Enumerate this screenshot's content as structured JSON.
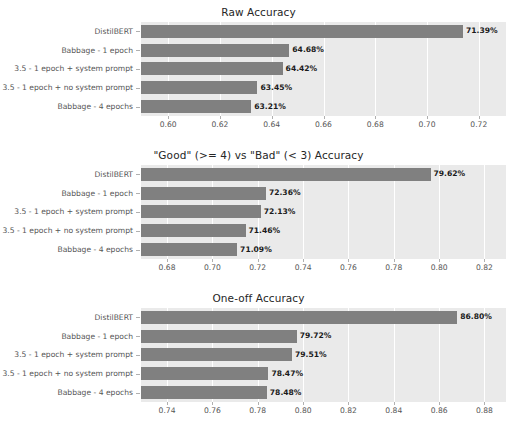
{
  "figure": {
    "width": 517,
    "height": 429,
    "background_color": "#ffffff",
    "plot_background_color": "#eaeaea",
    "bar_color": "#808080",
    "gridline_color": "#ffffff",
    "tick_label_color": "#555555",
    "title_color": "#262626",
    "value_label_color": "#1a1a1a"
  },
  "chart_data": [
    {
      "type": "bar",
      "orientation": "horizontal",
      "title": "Raw Accuracy",
      "xlabel": "",
      "ylabel": "",
      "grid": true,
      "legend": "none",
      "categories": [
        "DistilBERT",
        "Babbage - 1 epoch",
        "3.5 - 1 epoch + system prompt",
        "3.5 - 1 epoch + no system prompt",
        "Babbage - 4 epochs"
      ],
      "values": [
        0.7139,
        0.6468,
        0.6442,
        0.6345,
        0.6321
      ],
      "value_labels": [
        "71.39%",
        "64.68%",
        "64.42%",
        "63.45%",
        "63.21%"
      ],
      "xlim": [
        0.5895,
        0.7305
      ],
      "xticks": [
        0.6,
        0.62,
        0.64,
        0.66,
        0.68,
        0.7,
        0.72
      ],
      "xtick_labels": [
        "0.60",
        "0.62",
        "0.64",
        "0.66",
        "0.68",
        "0.70",
        "0.72"
      ]
    },
    {
      "type": "bar",
      "orientation": "horizontal",
      "title": "\"Good\" (>= 4) vs \"Bad\" (< 3) Accuracy",
      "xlabel": "",
      "ylabel": "",
      "grid": true,
      "legend": "none",
      "categories": [
        "DistilBERT",
        "Babbage - 1 epoch",
        "3.5 - 1 epoch + system prompt",
        "3.5 - 1 epoch + no system prompt",
        "Babbage - 4 epochs"
      ],
      "values": [
        0.7962,
        0.7236,
        0.7213,
        0.7146,
        0.7109
      ],
      "value_labels": [
        "79.62%",
        "72.36%",
        "72.13%",
        "71.46%",
        "71.09%"
      ],
      "xlim": [
        0.6685,
        0.8295
      ],
      "xticks": [
        0.68,
        0.7,
        0.72,
        0.74,
        0.76,
        0.78,
        0.8,
        0.82
      ],
      "xtick_labels": [
        "0.68",
        "0.70",
        "0.72",
        "0.74",
        "0.76",
        "0.78",
        "0.80",
        "0.82"
      ]
    },
    {
      "type": "bar",
      "orientation": "horizontal",
      "title": "One-off Accuracy",
      "xlabel": "",
      "ylabel": "",
      "grid": true,
      "legend": "none",
      "categories": [
        "DistilBERT",
        "Babbage - 1 epoch",
        "3.5 - 1 epoch + system prompt",
        "3.5 - 1 epoch + no system prompt",
        "Babbage - 4 epochs"
      ],
      "values": [
        0.868,
        0.7972,
        0.7951,
        0.7847,
        0.784
      ],
      "value_labels": [
        "86.80%",
        "79.72%",
        "79.51%",
        "78.47%",
        "78.48%"
      ],
      "xlim": [
        0.7285,
        0.8895
      ],
      "xticks": [
        0.74,
        0.76,
        0.78,
        0.8,
        0.82,
        0.84,
        0.86,
        0.88
      ],
      "xtick_labels": [
        "0.74",
        "0.76",
        "0.78",
        "0.80",
        "0.82",
        "0.84",
        "0.86",
        "0.88"
      ]
    }
  ]
}
